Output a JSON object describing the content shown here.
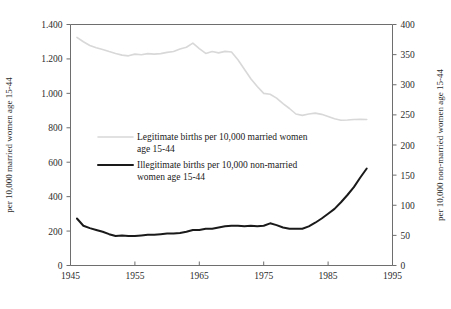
{
  "chart_data": {
    "type": "line",
    "title": "",
    "xlabel": "",
    "ylabel": "per 10,000 married women age 15-44",
    "y2label": "per 10,000 non-married women age 15-44",
    "xlim": [
      1945,
      1995
    ],
    "ylim": [
      0,
      1400
    ],
    "y2lim": [
      0,
      400
    ],
    "grid": false,
    "legend_position": "inside-center-left",
    "xticks": [
      "1945",
      "1955",
      "1965",
      "1975",
      "1985",
      "1995"
    ],
    "xtick_values": [
      1945,
      1955,
      1965,
      1975,
      1985,
      1995
    ],
    "yticks": [
      "0",
      "200",
      "400",
      "600",
      "800",
      "1.000",
      "1.200",
      "1.400"
    ],
    "ytick_values": [
      0,
      200,
      400,
      600,
      800,
      1000,
      1200,
      1400
    ],
    "y2ticks": [
      "0",
      "50",
      "100",
      "150",
      "200",
      "250",
      "300",
      "350",
      "400"
    ],
    "y2tick_values": [
      0,
      50,
      100,
      150,
      200,
      250,
      300,
      350,
      400
    ],
    "series": [
      {
        "name": "Legitimate births per 10,000 married women age 15-44",
        "legend_label_line1": "Legitimate births per 10,000 married women",
        "legend_label_line2": "age 15-44",
        "axis": "left",
        "color": "#d8d8d8",
        "width": 1.6,
        "x": [
          1946,
          1947,
          1948,
          1949,
          1950,
          1951,
          1952,
          1953,
          1954,
          1955,
          1956,
          1957,
          1958,
          1959,
          1960,
          1961,
          1962,
          1963,
          1964,
          1965,
          1966,
          1967,
          1968,
          1969,
          1970,
          1971,
          1972,
          1973,
          1974,
          1975,
          1976,
          1977,
          1978,
          1979,
          1980,
          1981,
          1982,
          1983,
          1984,
          1985,
          1986,
          1987,
          1988,
          1989,
          1990,
          1991
        ],
        "values": [
          1325,
          1300,
          1278,
          1265,
          1255,
          1243,
          1232,
          1222,
          1218,
          1228,
          1224,
          1231,
          1228,
          1231,
          1238,
          1243,
          1258,
          1268,
          1292,
          1260,
          1232,
          1243,
          1235,
          1244,
          1240,
          1195,
          1140,
          1085,
          1040,
          1000,
          995,
          972,
          940,
          912,
          880,
          872,
          880,
          885,
          878,
          866,
          852,
          844,
          845,
          848,
          850,
          848
        ]
      },
      {
        "name": "Illegitimate births per 10,000 non-married women age 15-44",
        "legend_label_line1": "Illegitimate births per 10,000 non-married",
        "legend_label_line2": "women age 15-44",
        "axis": "right",
        "color": "#1a1a1a",
        "width": 2.0,
        "x": [
          1946,
          1947,
          1948,
          1949,
          1950,
          1951,
          1952,
          1953,
          1954,
          1955,
          1956,
          1957,
          1958,
          1959,
          1960,
          1961,
          1962,
          1963,
          1964,
          1965,
          1966,
          1967,
          1968,
          1969,
          1970,
          1971,
          1972,
          1973,
          1974,
          1975,
          1976,
          1977,
          1978,
          1979,
          1980,
          1981,
          1982,
          1983,
          1984,
          1985,
          1986,
          1987,
          1988,
          1989,
          1990,
          1991
        ],
        "values_left_scale": [
          272,
          232,
          218,
          205,
          196,
          182,
          172,
          176,
          170,
          172,
          174,
          180,
          178,
          182,
          184,
          186,
          188,
          196,
          208,
          206,
          212,
          215,
          220,
          228,
          232,
          230,
          229,
          230,
          228,
          232,
          245,
          235,
          222,
          215,
          212,
          214,
          228,
          248,
          272,
          300,
          330,
          368,
          410,
          455,
          510,
          565
        ],
        "values": [
          78,
          66,
          62,
          59,
          56,
          52,
          49,
          50,
          49,
          49,
          50,
          51,
          51,
          52,
          53,
          53,
          54,
          56,
          59,
          59,
          61,
          61,
          63,
          65,
          66,
          66,
          65,
          66,
          65,
          66,
          70,
          67,
          63,
          61,
          61,
          61,
          65,
          71,
          78,
          86,
          94,
          105,
          117,
          130,
          146,
          161
        ]
      }
    ]
  }
}
